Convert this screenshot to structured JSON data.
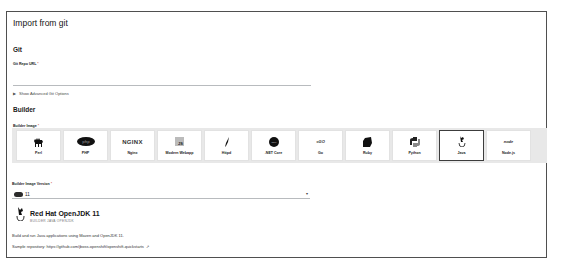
{
  "page": {
    "title": "Import from git"
  },
  "git": {
    "section_title": "Git",
    "repo_url_label": "Git Repo URL",
    "required_marker": "*",
    "repo_url_value": "",
    "advanced_toggle_label": "Show Advanced Git Options"
  },
  "builder": {
    "section_title": "Builder",
    "image_label": "Builder Image",
    "required_marker": "*",
    "tiles": [
      {
        "label": "Perl",
        "icon": "camel-icon",
        "glyph": "🐪"
      },
      {
        "label": "PHP",
        "icon": "php-icon",
        "glyph": "PHP"
      },
      {
        "label": "Nginx",
        "icon": "nginx-icon",
        "glyph": "NGINX"
      },
      {
        "label": "Modern Webapp",
        "icon": "js-icon",
        "glyph": "JS"
      },
      {
        "label": "Httpd",
        "icon": "feather-icon",
        "glyph": "/"
      },
      {
        "label": ".NET Core",
        "icon": "dotnet-icon",
        "glyph": "NET"
      },
      {
        "label": "Go",
        "icon": "go-icon",
        "glyph": "=GO"
      },
      {
        "label": "Ruby",
        "icon": "ruby-icon",
        "glyph": "◆"
      },
      {
        "label": "Python",
        "icon": "python-icon",
        "glyph": "❖"
      },
      {
        "label": "Java",
        "icon": "java-icon",
        "glyph": "♨"
      },
      {
        "label": "Node.js",
        "icon": "nodejs-icon",
        "glyph": "node"
      }
    ],
    "selected_tile": "Java",
    "version_label": "Builder Image Version",
    "version_value": "11",
    "details": {
      "title": "Red Hat OpenJDK 11",
      "tags": "BUILDER  JAVA  OPENJDK",
      "description": "Build and run Java applications using Maven and OpenJDK 11.",
      "sample_repo_label": "Sample repository:",
      "sample_repo_url": "https://github.com/jboss-openshift/openshift-quickstarts",
      "external_link_glyph": "↗"
    }
  }
}
